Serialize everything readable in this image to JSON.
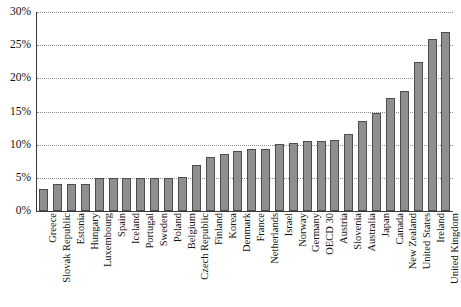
{
  "chart_data": {
    "type": "bar",
    "title": "",
    "xlabel": "",
    "ylabel": "",
    "ylim": [
      0,
      30
    ],
    "yticks": [
      0,
      5,
      10,
      15,
      20,
      25,
      30
    ],
    "ytick_labels": [
      "0%",
      "5%",
      "10%",
      "15%",
      "20%",
      "25%",
      "30%"
    ],
    "grid": true,
    "legend": "none",
    "bar_color": "#8f8f8f",
    "bar_border_color": "#4d4d4d",
    "gridline_color": "#8d8d8d",
    "axis_color": "#3a3a3a",
    "categories": [
      "Greece",
      "Slovak Republic",
      "Estonia",
      "Hungary",
      "Luxembourg",
      "Spain",
      "Iceland",
      "Portugal",
      "Sweden",
      "Poland",
      "Belgium",
      "Czech Republic",
      "Finland",
      "Korea",
      "Denmark",
      "France",
      "Netherlands",
      "Israel",
      "Norway",
      "Germany",
      "OECD 30",
      "Austria",
      "Slovenia",
      "Australia",
      "Japan",
      "Canada",
      "New Zealand",
      "United States",
      "Ireland",
      "United Kingdom"
    ],
    "values": [
      3.3,
      4.0,
      4.0,
      4.0,
      5.0,
      5.0,
      5.0,
      5.0,
      5.0,
      5.0,
      5.1,
      7.0,
      8.2,
      8.6,
      9.1,
      9.4,
      9.4,
      10.1,
      10.3,
      10.6,
      10.6,
      10.7,
      11.6,
      13.6,
      14.8,
      17.0,
      18.1,
      22.4,
      25.9,
      27.0
    ]
  }
}
